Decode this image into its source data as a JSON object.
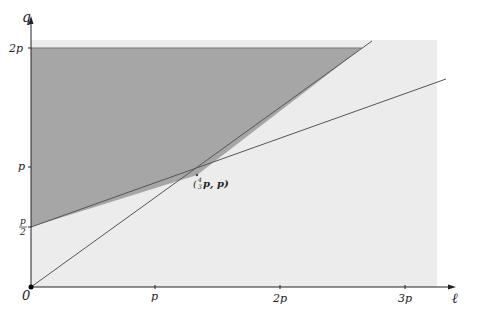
{
  "diagram": {
    "axes": {
      "x_label": "ℓ",
      "y_label": "q",
      "origin_label": "0",
      "x_ticks": [
        "p",
        "2p",
        "3p"
      ],
      "y_ticks": [
        "2p",
        "p",
        "p/2"
      ]
    },
    "y_tick_fraction": {
      "num": "p",
      "den": "2"
    },
    "intersection_label": {
      "prefix": "(",
      "frac_num": "4",
      "frac_den": "3",
      "suffix": "p, p)"
    },
    "colors": {
      "background_region": "#ececec",
      "shaded_region": "#a6a6a6",
      "lines": "#555555",
      "axes": "#222222"
    },
    "lines": [
      {
        "name": "steep-line",
        "from": [
          0,
          0
        ],
        "to": "through (4/3 p, p)",
        "slope": "3/4"
      },
      {
        "name": "shallow-line",
        "from": [
          0,
          "p/2"
        ],
        "to": "through (4/3 p, p)",
        "slope": "3/8"
      }
    ]
  }
}
